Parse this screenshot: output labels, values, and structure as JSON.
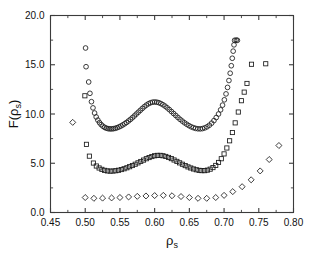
{
  "chart_data": {
    "type": "scatter",
    "title": "",
    "subtitle": "",
    "xlabel": "ρ",
    "xlabel_sub": "s",
    "ylabel": "F(ρ",
    "ylabel_sub": "s",
    "ylabel_tail": ")",
    "xlim": [
      0.45,
      0.8
    ],
    "ylim": [
      0.0,
      20.0
    ],
    "xticks": [
      0.45,
      0.5,
      0.55,
      0.6,
      0.65,
      0.7,
      0.75,
      0.8
    ],
    "xticklabels": [
      "0.45",
      "0.50",
      "0.55",
      "0.60",
      "0.65",
      "0.70",
      "0.75",
      "0.80"
    ],
    "yticks": [
      0.0,
      5.0,
      10.0,
      15.0,
      20.0
    ],
    "yticklabels": [
      "0.0",
      "5.0",
      "10.0",
      "15.0",
      "20.0"
    ],
    "xminorticks": [
      0.475,
      0.525,
      0.575,
      0.625,
      0.675,
      0.725,
      0.775
    ],
    "yminorticks": [
      2.5,
      7.5,
      12.5,
      17.5
    ],
    "grid": false,
    "legend": "none",
    "marker_color": "#1a1a1a",
    "axis_color": "#3b3b3b",
    "background": "#ffffff",
    "series": [
      {
        "name": "circles",
        "marker": "circle",
        "filled": false,
        "points": [
          [
            0.5005,
            16.7
          ],
          [
            0.5012,
            14.8
          ],
          [
            0.505,
            13.25
          ],
          [
            0.5068,
            12.1
          ],
          [
            0.509,
            11.25
          ],
          [
            0.5112,
            10.62
          ],
          [
            0.5135,
            10.1
          ],
          [
            0.5158,
            9.7
          ],
          [
            0.5182,
            9.38
          ],
          [
            0.5206,
            9.12
          ],
          [
            0.523,
            8.92
          ],
          [
            0.5255,
            8.76
          ],
          [
            0.528,
            8.64
          ],
          [
            0.5305,
            8.56
          ],
          [
            0.533,
            8.51
          ],
          [
            0.5356,
            8.49
          ],
          [
            0.5382,
            8.49
          ],
          [
            0.5408,
            8.51
          ],
          [
            0.5434,
            8.55
          ],
          [
            0.546,
            8.61
          ],
          [
            0.5487,
            8.69
          ],
          [
            0.5514,
            8.78
          ],
          [
            0.5541,
            8.89
          ],
          [
            0.5568,
            9.01
          ],
          [
            0.5595,
            9.14
          ],
          [
            0.5623,
            9.29
          ],
          [
            0.5651,
            9.45
          ],
          [
            0.5679,
            9.62
          ],
          [
            0.5707,
            9.8
          ],
          [
            0.5735,
            9.99
          ],
          [
            0.5764,
            10.18
          ],
          [
            0.5793,
            10.37
          ],
          [
            0.5822,
            10.56
          ],
          [
            0.5851,
            10.74
          ],
          [
            0.588,
            10.9
          ],
          [
            0.591,
            11.04
          ],
          [
            0.594,
            11.14
          ],
          [
            0.597,
            11.2
          ],
          [
            0.6,
            11.22
          ],
          [
            0.603,
            11.2
          ],
          [
            0.606,
            11.15
          ],
          [
            0.609,
            11.06
          ],
          [
            0.612,
            10.94
          ],
          [
            0.615,
            10.8
          ],
          [
            0.618,
            10.63
          ],
          [
            0.6211,
            10.45
          ],
          [
            0.6242,
            10.25
          ],
          [
            0.6273,
            10.05
          ],
          [
            0.6304,
            9.85
          ],
          [
            0.6335,
            9.65
          ],
          [
            0.6366,
            9.46
          ],
          [
            0.6398,
            9.28
          ],
          [
            0.643,
            9.11
          ],
          [
            0.6462,
            8.96
          ],
          [
            0.6494,
            8.82
          ],
          [
            0.6526,
            8.7
          ],
          [
            0.6558,
            8.61
          ],
          [
            0.659,
            8.54
          ],
          [
            0.6623,
            8.5
          ],
          [
            0.6656,
            8.49
          ],
          [
            0.6689,
            8.52
          ],
          [
            0.6722,
            8.59
          ],
          [
            0.6755,
            8.7
          ],
          [
            0.6788,
            8.86
          ],
          [
            0.6821,
            9.07
          ],
          [
            0.6854,
            9.33
          ],
          [
            0.6887,
            9.64
          ],
          [
            0.692,
            10.0
          ],
          [
            0.695,
            10.42
          ],
          [
            0.6978,
            10.9
          ],
          [
            0.7004,
            11.44
          ],
          [
            0.7028,
            12.04
          ],
          [
            0.705,
            12.7
          ],
          [
            0.707,
            13.4
          ],
          [
            0.7088,
            14.14
          ],
          [
            0.7104,
            14.9
          ],
          [
            0.7118,
            15.66
          ],
          [
            0.7131,
            16.38
          ],
          [
            0.7143,
            17.02
          ],
          [
            0.7152,
            17.48
          ],
          [
            0.7175,
            17.5
          ],
          [
            0.7192,
            17.48
          ]
        ]
      },
      {
        "name": "squares",
        "marker": "square",
        "filled": false,
        "points": [
          [
            0.4995,
            11.85
          ],
          [
            0.5018,
            6.92
          ],
          [
            0.506,
            5.72
          ],
          [
            0.5118,
            5.02
          ],
          [
            0.516,
            4.72
          ],
          [
            0.52,
            4.52
          ],
          [
            0.524,
            4.38
          ],
          [
            0.528,
            4.28
          ],
          [
            0.532,
            4.22
          ],
          [
            0.536,
            4.2
          ],
          [
            0.54,
            4.21
          ],
          [
            0.544,
            4.24
          ],
          [
            0.548,
            4.29
          ],
          [
            0.552,
            4.36
          ],
          [
            0.556,
            4.44
          ],
          [
            0.56,
            4.54
          ],
          [
            0.564,
            4.65
          ],
          [
            0.568,
            4.77
          ],
          [
            0.572,
            4.9
          ],
          [
            0.576,
            5.04
          ],
          [
            0.58,
            5.18
          ],
          [
            0.584,
            5.32
          ],
          [
            0.588,
            5.46
          ],
          [
            0.592,
            5.58
          ],
          [
            0.596,
            5.68
          ],
          [
            0.6,
            5.76
          ],
          [
            0.604,
            5.8
          ],
          [
            0.608,
            5.8
          ],
          [
            0.612,
            5.76
          ],
          [
            0.616,
            5.69
          ],
          [
            0.62,
            5.59
          ],
          [
            0.624,
            5.47
          ],
          [
            0.628,
            5.33
          ],
          [
            0.632,
            5.19
          ],
          [
            0.636,
            5.04
          ],
          [
            0.64,
            4.9
          ],
          [
            0.644,
            4.76
          ],
          [
            0.648,
            4.63
          ],
          [
            0.652,
            4.52
          ],
          [
            0.656,
            4.42
          ],
          [
            0.66,
            4.34
          ],
          [
            0.664,
            4.28
          ],
          [
            0.668,
            4.25
          ],
          [
            0.672,
            4.25
          ],
          [
            0.676,
            4.3
          ],
          [
            0.68,
            4.4
          ],
          [
            0.684,
            4.56
          ],
          [
            0.688,
            4.78
          ],
          [
            0.692,
            5.08
          ],
          [
            0.696,
            5.46
          ],
          [
            0.7,
            5.95
          ],
          [
            0.704,
            6.55
          ],
          [
            0.708,
            7.28
          ],
          [
            0.712,
            8.12
          ],
          [
            0.716,
            9.1
          ],
          [
            0.7205,
            10.2
          ],
          [
            0.725,
            11.35
          ],
          [
            0.729,
            12.22
          ],
          [
            0.733,
            13.1
          ],
          [
            0.7395,
            15.05
          ],
          [
            0.76,
            15.1
          ]
        ]
      },
      {
        "name": "diamonds",
        "marker": "diamond",
        "filled": false,
        "points": [
          [
            0.482,
            9.15
          ],
          [
            0.5,
            1.52
          ],
          [
            0.5125,
            1.44
          ],
          [
            0.525,
            1.46
          ],
          [
            0.538,
            1.48
          ],
          [
            0.55,
            1.52
          ],
          [
            0.5625,
            1.58
          ],
          [
            0.575,
            1.64
          ],
          [
            0.5875,
            1.68
          ],
          [
            0.6,
            1.72
          ],
          [
            0.6125,
            1.74
          ],
          [
            0.625,
            1.7
          ],
          [
            0.638,
            1.62
          ],
          [
            0.65,
            1.52
          ],
          [
            0.6625,
            1.44
          ],
          [
            0.675,
            1.44
          ],
          [
            0.688,
            1.52
          ],
          [
            0.7,
            1.74
          ],
          [
            0.7125,
            2.12
          ],
          [
            0.726,
            2.62
          ],
          [
            0.739,
            3.32
          ],
          [
            0.752,
            4.22
          ],
          [
            0.765,
            5.38
          ],
          [
            0.779,
            6.8
          ]
        ]
      }
    ]
  }
}
